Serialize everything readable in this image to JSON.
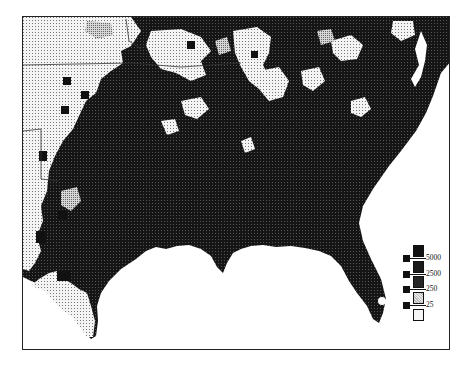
{
  "map": {
    "title": "",
    "region": "Southeastern United States",
    "colors": {
      "level_5000": "#111111",
      "level_2500": "#1e1e1e",
      "level_250": "#2c2c2c",
      "level_25": "#c8c8c8",
      "level_0": "#f2f2f2",
      "water": "#ffffff",
      "border": "#222222"
    }
  },
  "legend": {
    "items": [
      {
        "label": "5000",
        "pattern": "solid-black"
      },
      {
        "label": "2500",
        "pattern": "dark-dotted"
      },
      {
        "label": "250",
        "pattern": "dark-gray"
      },
      {
        "label": "25",
        "pattern": "light-dotted"
      },
      {
        "label": "",
        "pattern": "white-dotted"
      }
    ]
  }
}
